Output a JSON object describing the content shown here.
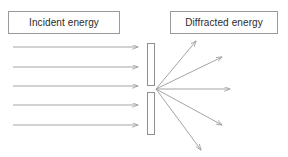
{
  "diagram": {
    "canvas": {
      "width": 288,
      "height": 157,
      "background": "#ffffff"
    },
    "stroke_color": "#9a9a9a",
    "text_color": "#2b2b2b",
    "labels": {
      "incident": "Incident energy",
      "diffracted": "Diffracted energy"
    },
    "boxes": [
      {
        "name": "incident-box",
        "x": 8,
        "y": 11,
        "width": 112,
        "height": 23
      },
      {
        "name": "diffracted-box",
        "x": 170,
        "y": 11,
        "width": 108,
        "height": 23
      }
    ],
    "incident_rays": [
      {
        "x1": 13,
        "y1": 47,
        "x2": 138,
        "y2": 47
      },
      {
        "x1": 13,
        "y1": 67,
        "x2": 138,
        "y2": 67
      },
      {
        "x1": 13,
        "y1": 86,
        "x2": 138,
        "y2": 86
      },
      {
        "x1": 13,
        "y1": 105,
        "x2": 138,
        "y2": 105
      },
      {
        "x1": 13,
        "y1": 125,
        "x2": 138,
        "y2": 125
      }
    ],
    "barrier": {
      "upper": {
        "x": 147,
        "y": 43,
        "width": 7,
        "height": 42
      },
      "lower": {
        "x": 147,
        "y": 92,
        "width": 7,
        "height": 42
      },
      "slit_gap": {
        "x": 147,
        "y": 85,
        "width": 7,
        "height": 7
      }
    },
    "diffraction_origin": {
      "x": 156,
      "y": 89
    },
    "diffracted_rays": [
      {
        "x1": 156,
        "y1": 89,
        "x2": 196,
        "y2": 41
      },
      {
        "x1": 156,
        "y1": 89,
        "x2": 222,
        "y2": 57
      },
      {
        "x1": 156,
        "y1": 89,
        "x2": 230,
        "y2": 89
      },
      {
        "x1": 156,
        "y1": 89,
        "x2": 222,
        "y2": 125
      },
      {
        "x1": 156,
        "y1": 89,
        "x2": 201,
        "y2": 150
      }
    ]
  }
}
